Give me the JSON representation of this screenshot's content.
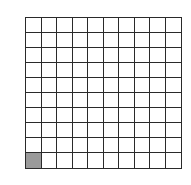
{
  "grid": {
    "rows": 10,
    "columns": 10,
    "total_cells": 100,
    "shaded_cells": [
      {
        "row": 10,
        "col": 1
      }
    ],
    "shaded_count": 1,
    "shaded_fraction": "1/100",
    "colors": {
      "line": "#2a2a2a",
      "cell": "#ffffff",
      "shaded": "#9a9a9a"
    }
  }
}
